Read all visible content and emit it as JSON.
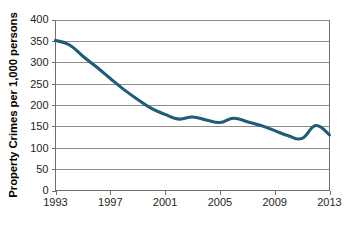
{
  "chart_data": {
    "type": "line",
    "title": "",
    "subtitle": "",
    "xlabel": "",
    "ylabel": "Property Crimes per 1,000 persons",
    "xlim": [
      1993,
      2013
    ],
    "ylim": [
      0,
      400
    ],
    "ytick_step": 50,
    "xtick_step": 4,
    "grid": "horizontal",
    "legend": "none",
    "line_color": "#1f5c77",
    "grid_color": "#8c8c8c",
    "axis_color": "#6f6f6f",
    "background_color": "#ffffff",
    "x": [
      1993,
      1994,
      1995,
      1996,
      1997,
      1998,
      1999,
      2000,
      2001,
      2002,
      2003,
      2004,
      2005,
      2006,
      2007,
      2008,
      2009,
      2010,
      2011,
      2012,
      2013
    ],
    "series": [
      {
        "name": "Property Crimes per 1,000 persons",
        "values": [
          351,
          341,
          314,
          289,
          262,
          236,
          213,
          192,
          178,
          167,
          172,
          165,
          159,
          169,
          161,
          152,
          140,
          128,
          122,
          152,
          130
        ]
      }
    ],
    "ytick_labels": [
      "400",
      "350",
      "300",
      "250",
      "200",
      "150",
      "100",
      "50",
      "0"
    ],
    "ytick_values": [
      400,
      350,
      300,
      250,
      200,
      150,
      100,
      50,
      0
    ],
    "xtick_labels": [
      "1993",
      "1997",
      "2001",
      "2005",
      "2009",
      "2013"
    ],
    "xtick_values": [
      1993,
      1997,
      2001,
      2005,
      2009,
      2013
    ],
    "annotations": []
  }
}
